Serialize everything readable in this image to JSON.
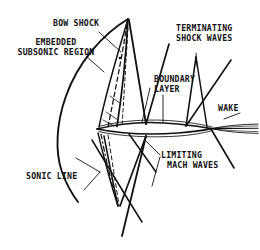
{
  "figure": {
    "type": "technical-line-diagram",
    "width": 260,
    "height": 250,
    "ink_color": "#111111",
    "background_color": "#ffffff"
  },
  "labels": {
    "bow_shock": "BOW SHOCK",
    "embedded_line1": "EMBEDDED",
    "embedded_line2": "SUBSONIC REGION",
    "terminating_line1": "TERMINATING",
    "terminating_line2": "SHOCK WAVES",
    "boundary_line1": "BOUNDARY",
    "boundary_line2": "LAYER",
    "wake": "WAKE",
    "limiting_line1": "LIMITING",
    "limiting_line2": "MACH WAVES",
    "sonic_line": "SONIC LINE"
  },
  "features": [
    {
      "name": "bow-shock",
      "style": "solid",
      "description": "detached curved shock ahead of and wrapping around the body"
    },
    {
      "name": "embedded-subsonic-region",
      "style": "solid",
      "description": "pocket of subsonic flow bounded by the sonic line"
    },
    {
      "name": "sonic-line",
      "style": "dashed",
      "description": "dashed locus where local Mach number equals one"
    },
    {
      "name": "terminating-shock-waves",
      "style": "solid",
      "description": "shocks closing the supersonic pockets above and below the body"
    },
    {
      "name": "limiting-mach-waves",
      "style": "solid",
      "description": "limiting characteristics bounding the supersonic region"
    },
    {
      "name": "boundary-layer",
      "style": "solid",
      "description": "thin viscous layer hugging the body surface"
    },
    {
      "name": "wake",
      "style": "solid",
      "description": "viscous wake trailing aft of the body"
    },
    {
      "name": "body",
      "style": "solid",
      "description": "slender lens-shaped body profile"
    }
  ]
}
